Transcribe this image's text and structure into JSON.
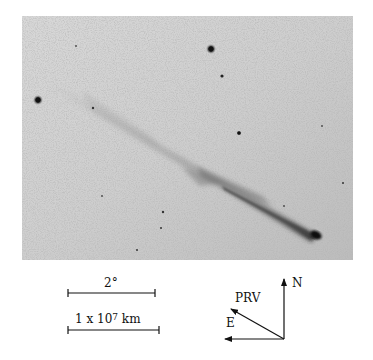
{
  "figure": {
    "photo": {
      "background": "#cdcdcd",
      "background_edge": "#bdbdbd",
      "tail_color": "#7a7a7a",
      "nucleus_color": "#111111",
      "nucleus": {
        "x": 294,
        "y": 219
      },
      "tail_end": {
        "x": 28,
        "y": 68
      },
      "stars": [
        {
          "x": 16,
          "y": 84,
          "r": 3.2
        },
        {
          "x": 189,
          "y": 33,
          "r": 3.2
        },
        {
          "x": 200,
          "y": 60,
          "r": 1.6
        },
        {
          "x": 217,
          "y": 117,
          "r": 2.0
        },
        {
          "x": 71,
          "y": 92,
          "r": 1.3
        },
        {
          "x": 141,
          "y": 196,
          "r": 1.3
        },
        {
          "x": 139,
          "y": 212,
          "r": 1.0
        },
        {
          "x": 115,
          "y": 234,
          "r": 1.0
        },
        {
          "x": 321,
          "y": 167,
          "r": 1.0
        }
      ]
    },
    "scale_bars": {
      "angular": {
        "label": "2°"
      },
      "linear": {
        "label_mantissa": "1 x 10",
        "label_exponent": "7",
        "label_unit": " km"
      }
    },
    "compass": {
      "north_label": "N",
      "east_label": "E",
      "velocity_label": "PRV"
    }
  }
}
